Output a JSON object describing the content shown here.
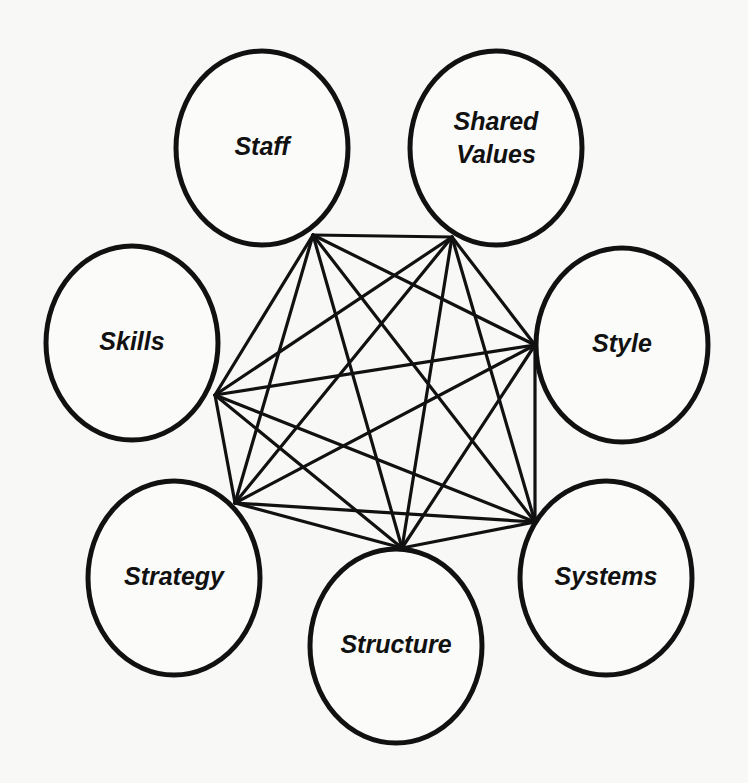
{
  "diagram": {
    "type": "complete-graph",
    "title": "",
    "colors": {
      "background": "#f8f8f7",
      "stroke": "#111111",
      "node_fill": "#fbfbfa"
    },
    "nodes": [
      {
        "id": "staff",
        "label_lines": [
          "Staff"
        ],
        "cx": 262,
        "cy": 148,
        "rx": 86,
        "ry": 97,
        "anchor": [
          313,
          235
        ]
      },
      {
        "id": "shared-values",
        "label_lines": [
          "Shared",
          "Values"
        ],
        "cx": 496,
        "cy": 148,
        "rx": 86,
        "ry": 97,
        "anchor": [
          452,
          237
        ]
      },
      {
        "id": "skills",
        "label_lines": [
          "Skills"
        ],
        "cx": 132,
        "cy": 343,
        "rx": 86,
        "ry": 97,
        "anchor": [
          215,
          395
        ]
      },
      {
        "id": "style",
        "label_lines": [
          "Style"
        ],
        "cx": 622,
        "cy": 345,
        "rx": 86,
        "ry": 97,
        "anchor": [
          535,
          345
        ]
      },
      {
        "id": "strategy",
        "label_lines": [
          "Strategy"
        ],
        "cx": 174,
        "cy": 578,
        "rx": 86,
        "ry": 97,
        "anchor": [
          235,
          503
        ]
      },
      {
        "id": "systems",
        "label_lines": [
          "Systems"
        ],
        "cx": 606,
        "cy": 578,
        "rx": 86,
        "ry": 97,
        "anchor": [
          535,
          522
        ]
      },
      {
        "id": "structure",
        "label_lines": [
          "Structure"
        ],
        "cx": 396,
        "cy": 646,
        "rx": 86,
        "ry": 97,
        "anchor": [
          402,
          548
        ]
      }
    ],
    "edges": "all-pairs (21 connections between the 7 elements)"
  }
}
